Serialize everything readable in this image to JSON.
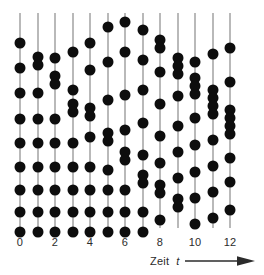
{
  "figure": {
    "type": "raster-plot",
    "background_color": "#ffffff",
    "dot_color": "#0d0d0d",
    "line_color": "#b9b9b9",
    "axis_caption_word": "Zeit",
    "axis_caption_variable": "t",
    "arrow_icon": "right-arrow-icon"
  },
  "chart_data": {
    "type": "scatter",
    "title": "",
    "xlabel": "Zeit t",
    "ylabel": "",
    "xlim": [
      -0.5,
      12.5
    ],
    "ylim": [
      0,
      100
    ],
    "grid": false,
    "legend": null,
    "x_ticks": [
      0,
      2,
      4,
      6,
      8,
      10,
      12
    ],
    "x_tick_labels": [
      "0",
      "2",
      "4",
      "6",
      "8",
      "10",
      "12"
    ],
    "trial_positions": [
      0,
      1,
      2,
      3,
      4,
      5,
      6,
      7,
      8,
      9,
      10,
      11,
      12
    ],
    "note": "Each vertical line is one trial at integer time t; each dot is an event. y values are vertical positions in plot-area pixels measured from the top of the axis line.",
    "series": [
      {
        "name": "t=0",
        "x": 0,
        "values": [
          43,
          68,
          93,
          119,
          143,
          167,
          190,
          212,
          232,
          252
        ]
      },
      {
        "name": "t=1",
        "x": 1,
        "values": [
          57,
          65,
          93,
          119,
          143,
          167,
          190,
          212,
          232,
          252
        ]
      },
      {
        "name": "t=2",
        "x": 2,
        "values": [
          58,
          76,
          84,
          119,
          143,
          167,
          190,
          212,
          232,
          252
        ]
      },
      {
        "name": "t=3",
        "x": 3,
        "values": [
          52,
          90,
          104,
          112,
          143,
          167,
          190,
          212,
          232,
          252
        ]
      },
      {
        "name": "t=4",
        "x": 4,
        "values": [
          43,
          70,
          108,
          116,
          137,
          167,
          190,
          212,
          232,
          252
        ]
      },
      {
        "name": "t=5",
        "x": 5,
        "values": [
          27,
          62,
          100,
          133,
          141,
          170,
          190,
          212,
          232,
          252
        ]
      },
      {
        "name": "t=6",
        "x": 6,
        "values": [
          22,
          52,
          95,
          130,
          152,
          160,
          190,
          212,
          232,
          252
        ]
      },
      {
        "name": "t=7",
        "x": 7,
        "values": [
          30,
          60,
          90,
          123,
          155,
          175,
          183,
          212,
          232,
          252
        ]
      },
      {
        "name": "t=8",
        "x": 8,
        "values": [
          40,
          48,
          72,
          104,
          136,
          163,
          185,
          193,
          220,
          250
        ]
      },
      {
        "name": "t=9",
        "x": 9,
        "values": [
          58,
          66,
          74,
          96,
          126,
          152,
          178,
          199,
          207,
          243
        ]
      },
      {
        "name": "t=10",
        "x": 10,
        "values": [
          62,
          78,
          86,
          94,
          118,
          145,
          172,
          198,
          224,
          262
        ]
      },
      {
        "name": "t=11",
        "x": 11,
        "values": [
          54,
          90,
          98,
          106,
          114,
          140,
          166,
          192,
          218,
          272
        ]
      },
      {
        "name": "t=12",
        "x": 12,
        "values": [
          48,
          82,
          110,
          118,
          126,
          134,
          158,
          182,
          210,
          256
        ]
      }
    ]
  }
}
